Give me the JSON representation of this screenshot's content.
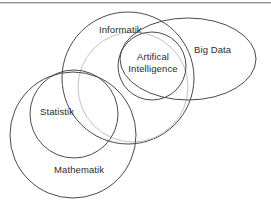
{
  "diagram": {
    "background_color": "#ffffff",
    "stroke_dark": "#4a4a4a",
    "stroke_light": "#c3c3c7",
    "text_color": "#2b2b2b",
    "top_rule_color": "#9a9a9e",
    "sets": [
      {
        "id": "informatik",
        "label": "Informatik",
        "shape": "circle",
        "cx": 128,
        "cy": 78,
        "r": 66,
        "stroke": "#4a4a4a",
        "stroke_width": 1,
        "label_x": 99,
        "label_y": 24
      },
      {
        "id": "data-science-ring",
        "label": "",
        "shape": "circle",
        "cx": 133,
        "cy": 87,
        "r": 55,
        "stroke": "#c3c3c7",
        "stroke_width": 1,
        "label_x": null,
        "label_y": null
      },
      {
        "id": "artifical-intelligence",
        "label": "Artifical Intelligence",
        "label_line_1": "Artifical",
        "label_line_2": "Intelligence",
        "shape": "circle",
        "cx": 152,
        "cy": 66,
        "r": 34,
        "stroke": "#4a4a4a",
        "stroke_width": 1,
        "label_x": 120,
        "label_y": 51
      },
      {
        "id": "big-data",
        "label": "Big Data",
        "shape": "ellipse",
        "cx": 188,
        "cy": 59,
        "rx": 68,
        "ry": 41,
        "stroke": "#4a4a4a",
        "stroke_width": 1,
        "label_x": 194,
        "label_y": 44
      },
      {
        "id": "statistik",
        "label": "Statistik",
        "shape": "circle",
        "cx": 74,
        "cy": 114,
        "r": 44,
        "stroke": "#4a4a4a",
        "stroke_width": 1,
        "label_x": 40,
        "label_y": 106
      },
      {
        "id": "mathematik",
        "label": "Mathematik",
        "shape": "circle",
        "cx": 73,
        "cy": 135,
        "r": 63,
        "stroke": "#4a4a4a",
        "stroke_width": 1,
        "label_x": 54,
        "label_y": 164
      }
    ]
  }
}
